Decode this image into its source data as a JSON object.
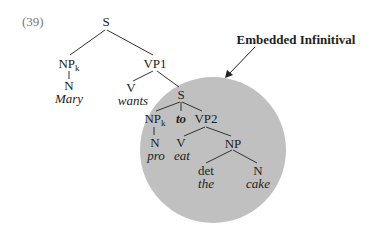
{
  "example_number": "(39)",
  "annotation": {
    "label": "Embedded Infinitival",
    "highlight_color": "#c0c0c0"
  },
  "tree": {
    "root": {
      "label": "S"
    },
    "subject_np": {
      "label": "NP",
      "index": "k"
    },
    "subject_n": {
      "label": "N",
      "word": "Mary"
    },
    "vp1": {
      "label": "VP1"
    },
    "v_wants": {
      "label": "V",
      "word": "wants"
    },
    "embedded_s": {
      "label": "S"
    },
    "embedded_np": {
      "label": "NP",
      "index": "k"
    },
    "to": {
      "word": "to"
    },
    "vp2": {
      "label": "VP2"
    },
    "n_pro": {
      "label": "N",
      "word": "pro"
    },
    "v_eat": {
      "label": "V",
      "word": "eat"
    },
    "obj_np": {
      "label": "NP"
    },
    "det": {
      "label": "det",
      "word": "the"
    },
    "n_cake": {
      "label": "N",
      "word": "cake"
    }
  }
}
